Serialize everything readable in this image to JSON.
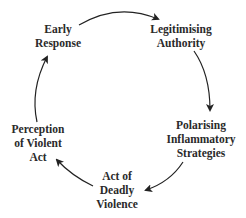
{
  "diagram": {
    "type": "cycle",
    "nodes": [
      {
        "id": "early-response",
        "lines": [
          "Early",
          "Response"
        ]
      },
      {
        "id": "legitimising-authority",
        "lines": [
          "Legitimising",
          "Authority"
        ]
      },
      {
        "id": "polarising-inflammatory-strategies",
        "lines": [
          "Polarising",
          "Inflammatory",
          "Strategies"
        ]
      },
      {
        "id": "act-of-deadly-violence",
        "lines": [
          "Act of",
          "Deadly",
          "Violence"
        ]
      },
      {
        "id": "perception-of-violent-act",
        "lines": [
          "Perception",
          "of Violent",
          "Act"
        ]
      }
    ],
    "edges": [
      {
        "from": "early-response",
        "to": "legitimising-authority"
      },
      {
        "from": "legitimising-authority",
        "to": "polarising-inflammatory-strategies"
      },
      {
        "from": "polarising-inflammatory-strategies",
        "to": "act-of-deadly-violence"
      },
      {
        "from": "act-of-deadly-violence",
        "to": "perception-of-violent-act"
      },
      {
        "from": "perception-of-violent-act",
        "to": "early-response"
      }
    ],
    "colors": {
      "text": "#2a2a2a",
      "arrow": "#222222",
      "background": "#ffffff"
    }
  }
}
